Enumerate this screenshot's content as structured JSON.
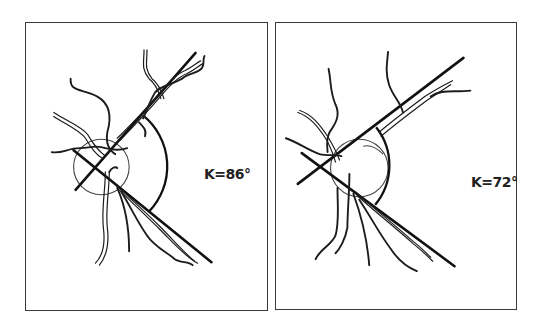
{
  "figure": {
    "stroke_color": "#1c1c1c",
    "background_color": "#ffffff",
    "panels": [
      {
        "id": "left",
        "angle_symbol": "κ",
        "angle_value_deg": 86,
        "label": "ꓗ=86°"
      },
      {
        "id": "right",
        "angle_symbol": "κ",
        "angle_value_deg": 72,
        "label": "ꓗ=72°"
      }
    ]
  }
}
